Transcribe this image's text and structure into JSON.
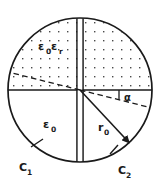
{
  "figure": {
    "labels": {
      "dielectric_region": "ε₀ε",
      "dielectric_region_sub": "r",
      "vacuum_region": "ε",
      "vacuum_region_sub": "0",
      "radius": "r",
      "radius_sub": "0",
      "angle": "α",
      "electrode_left": "C",
      "electrode_left_sub": "1",
      "electrode_right": "C",
      "electrode_right_sub": "2"
    },
    "epsilon_zero_eps_r": {
      "eps": "ε",
      "zero": "0",
      "eps2": "ε",
      "r": "r"
    },
    "colors": {
      "stroke": "#1a1a1a",
      "background": "#ffffff",
      "stipple": "#555555",
      "dashed": "#1a1a1a"
    },
    "geometry": {
      "center_x": 80,
      "center_y": 90,
      "radius": 72,
      "gap_width": 6,
      "alpha_degrees": 14,
      "r0_degrees": 47
    },
    "regions": [
      {
        "name": "upper-half",
        "fill": "stippled",
        "label": "ε₀εr"
      },
      {
        "name": "lower-left",
        "fill": "plain",
        "label": "ε₀"
      },
      {
        "name": "lower-right",
        "fill": "plain",
        "label": ""
      }
    ],
    "annotations": [
      {
        "name": "angle-alpha",
        "text": "α"
      },
      {
        "name": "radius-arrow",
        "text": "r₀"
      },
      {
        "name": "arc-c1",
        "text": "C₁"
      },
      {
        "name": "arc-c2",
        "text": "C₂"
      }
    ]
  }
}
